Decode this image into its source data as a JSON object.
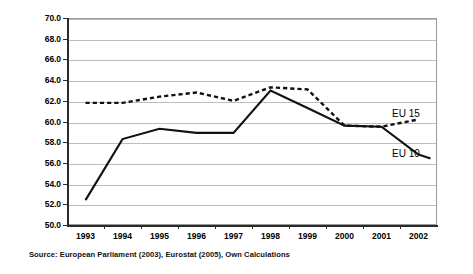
{
  "chart_data": {
    "type": "line",
    "title": "",
    "subtitle": "",
    "xlabel": "",
    "ylabel": "",
    "categories": [
      "1993",
      "1994",
      "1995",
      "1996",
      "1997",
      "1998",
      "1999",
      "2000",
      "2001",
      "2002"
    ],
    "x": [
      1993,
      1994,
      1995,
      1996,
      1997,
      1998,
      1999,
      2000,
      2001,
      2002
    ],
    "ylim": [
      50.0,
      70.0
    ],
    "ytick_values": [
      50.0,
      52.0,
      54.0,
      56.0,
      58.0,
      60.0,
      62.0,
      64.0,
      66.0,
      68.0,
      70.0
    ],
    "ytick_labels": [
      "50.0",
      "52.0",
      "54.0",
      "56.0",
      "58.0",
      "60.0",
      "62.0",
      "64.0",
      "66.0",
      "68.0",
      "70.0"
    ],
    "xtick_labels": [
      "1993",
      "1994",
      "1995",
      "1996",
      "1997",
      "1998",
      "1999",
      "2000",
      "2001",
      "2002"
    ],
    "grid": true,
    "grid_axis": "y",
    "legend_position": "inline-right",
    "series": [
      {
        "name": "EU 15",
        "style": "dashed",
        "color": "#111111",
        "values": [
          61.8,
          61.8,
          62.4,
          62.8,
          62.0,
          63.3,
          63.1,
          59.6,
          59.5,
          60.2
        ]
      },
      {
        "name": "EU 10",
        "style": "solid",
        "color": "#111111",
        "values": [
          52.4,
          58.3,
          59.3,
          58.9,
          58.9,
          63.0,
          61.3,
          59.6,
          59.5,
          56.8
        ]
      }
    ],
    "annotations": [
      {
        "name": "series-label-eu15",
        "text": "EU 15"
      },
      {
        "name": "series-label-eu10",
        "text": "EU 10"
      }
    ]
  },
  "legend": {
    "eu15_label": "EU 15",
    "eu10_label": "EU 10"
  },
  "footer": {
    "source_note": "Source: European Parliament (2003), Eurostat (2005), Own Calculations"
  },
  "colors": {
    "line": "#111111",
    "gridline": "#bdbdbd",
    "axis": "#2b2b2b",
    "background": "#ffffff",
    "text": "#000000"
  }
}
